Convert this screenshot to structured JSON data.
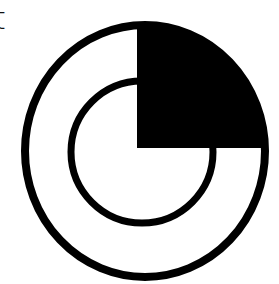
{
  "clipped_label": {
    "text": "t"
  },
  "icon": {
    "name": "quarter-filled-concentric-ring-icon",
    "stroke_color": "#000000",
    "fill_color": "#000000",
    "background": "#ffffff"
  }
}
